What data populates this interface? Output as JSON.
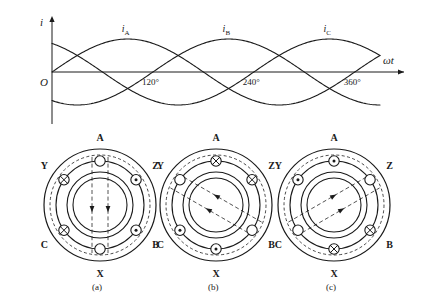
{
  "figure": {
    "background": "#ffffff",
    "ink": "#1a1a1a"
  },
  "waveform": {
    "y_axis_label": "i",
    "x_axis_label": "ωt",
    "origin_label": "O",
    "tick_labels": [
      "120°",
      "240°",
      "360°"
    ],
    "curve_labels": [
      {
        "base": "i",
        "sub": "A"
      },
      {
        "base": "i",
        "sub": "B"
      },
      {
        "base": "i",
        "sub": "C"
      }
    ]
  },
  "chart_data": {
    "type": "line",
    "title": "",
    "xlabel": "ωt",
    "ylabel": "i",
    "x": [
      0,
      30,
      60,
      90,
      120,
      150,
      180,
      210,
      240,
      270,
      300,
      330,
      360
    ],
    "xlim": [
      0,
      390
    ],
    "ylim": [
      -1.15,
      1.15
    ],
    "xticks": [
      120,
      240,
      360
    ],
    "xticklabels": [
      "120°",
      "240°",
      "360°"
    ],
    "grid": false,
    "legend": "inline-curve-labels",
    "series": [
      {
        "name": "iA",
        "phase_deg": 0,
        "amplitude": 1,
        "values": [
          0,
          0.5,
          0.866,
          1,
          0.866,
          0.5,
          0,
          -0.5,
          -0.866,
          -1,
          -0.866,
          -0.5,
          0
        ]
      },
      {
        "name": "iB",
        "phase_deg": -120,
        "amplitude": 1,
        "values": [
          -0.866,
          -0.5,
          0,
          0.5,
          0.866,
          1,
          0.866,
          0.5,
          0,
          -0.5,
          -0.866,
          -1,
          -0.866
        ]
      },
      {
        "name": "iC",
        "phase_deg": 120,
        "amplitude": 1,
        "values": [
          0.866,
          1,
          0.866,
          0.5,
          0,
          -0.5,
          -0.866,
          -1,
          -0.866,
          -0.5,
          0,
          0.5,
          0.866
        ]
      }
    ]
  },
  "stator_diagrams": [
    {
      "caption": "(a)",
      "instant_deg": 0,
      "field_angle_deg": 90,
      "slots": [
        {
          "label": "A",
          "position": "top",
          "current": "zero"
        },
        {
          "label": "Z",
          "position": "upper-right",
          "current": "out"
        },
        {
          "label": "B",
          "position": "lower-right",
          "current": "out"
        },
        {
          "label": "X",
          "position": "bottom",
          "current": "zero"
        },
        {
          "label": "C",
          "position": "lower-left",
          "current": "in"
        },
        {
          "label": "Y",
          "position": "upper-left",
          "current": "in"
        }
      ]
    },
    {
      "caption": "(b)",
      "instant_deg": 120,
      "field_angle_deg": 210,
      "slots": [
        {
          "label": "A",
          "position": "top",
          "current": "in"
        },
        {
          "label": "Z",
          "position": "upper-right",
          "current": "in"
        },
        {
          "label": "B",
          "position": "lower-right",
          "current": "zero"
        },
        {
          "label": "X",
          "position": "bottom",
          "current": "out"
        },
        {
          "label": "C",
          "position": "lower-left",
          "current": "out"
        },
        {
          "label": "Y",
          "position": "upper-left",
          "current": "zero"
        }
      ]
    },
    {
      "caption": "(c)",
      "instant_deg": 240,
      "field_angle_deg": 330,
      "slots": [
        {
          "label": "A",
          "position": "top",
          "current": "out"
        },
        {
          "label": "Z",
          "position": "upper-right",
          "current": "zero"
        },
        {
          "label": "B",
          "position": "lower-right",
          "current": "in"
        },
        {
          "label": "X",
          "position": "bottom",
          "current": "in"
        },
        {
          "label": "C",
          "position": "lower-left",
          "current": "zero"
        },
        {
          "label": "Y",
          "position": "upper-left",
          "current": "out"
        }
      ]
    }
  ]
}
